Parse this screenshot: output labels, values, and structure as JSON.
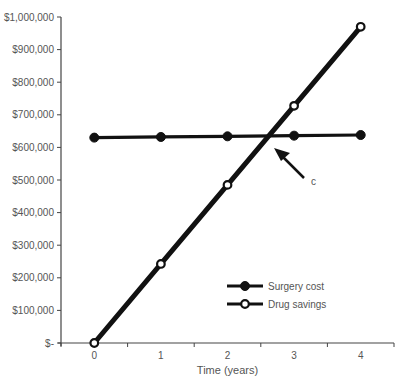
{
  "chart_data": {
    "type": "line",
    "title": "",
    "xlabel": "Time (years)",
    "ylabel": "",
    "x": [
      0,
      1,
      2,
      3,
      4
    ],
    "xlim": [
      -0.5,
      4.5
    ],
    "ylim": [
      0,
      1000000
    ],
    "ytick_labels": [
      "$-",
      "$100,000",
      "$200,000",
      "$300,000",
      "$400,000",
      "$500,000",
      "$600,000",
      "$700,000",
      "$800,000",
      "$900,000",
      "$1,000,000"
    ],
    "ytick_values": [
      0,
      100000,
      200000,
      300000,
      400000,
      500000,
      600000,
      700000,
      800000,
      900000,
      1000000
    ],
    "xtick_labels": [
      "0",
      "1",
      "2",
      "3",
      "4"
    ],
    "grid": false,
    "legend_position": "lower right (inside plot)",
    "series": [
      {
        "name": "Surgery cost",
        "marker": "filled-diamond",
        "color": "#111111",
        "values": [
          630000,
          632000,
          634000,
          636000,
          638000
        ]
      },
      {
        "name": "Drug savings",
        "marker": "open-circle",
        "color": "#111111",
        "values": [
          0,
          242500,
          485000,
          727500,
          970000
        ]
      }
    ],
    "annotations": [
      {
        "text": "c",
        "type": "arrow",
        "points_to": "intersection of Surgery cost and Drug savings (~2.6 years, ~$635,000)"
      }
    ]
  }
}
